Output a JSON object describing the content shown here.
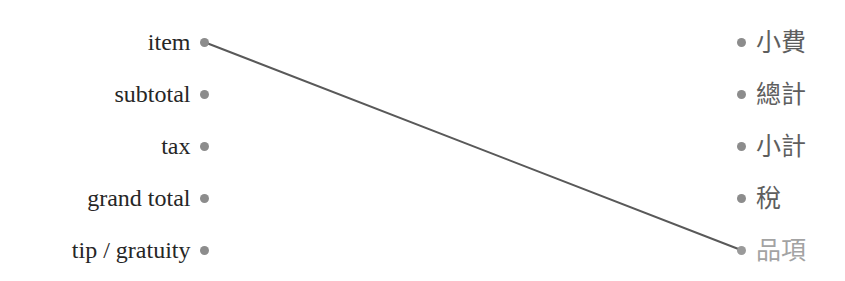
{
  "diagram": {
    "type": "bipartite-alignment",
    "width": 845,
    "height": 281,
    "background_color": "#ffffff",
    "row_spacing_px": 52,
    "first_row_y_px": 42,
    "left_column_dot_x_px": 204,
    "right_column_dot_x_px": 741,
    "edge_color": "#595959",
    "edge_width_px": 2,
    "dot_color": "#8c8c8c",
    "left_text_color": "#262626",
    "right_text_color": "#5e5e5e",
    "right_text_dim_color": "#a3a3a3"
  },
  "left_column": {
    "name": "english-receipt-terms",
    "nodes": [
      {
        "id": "item",
        "label": "item",
        "row": 1,
        "y": 42
      },
      {
        "id": "subtotal",
        "label": "subtotal",
        "row": 2,
        "y": 94
      },
      {
        "id": "tax",
        "label": "tax",
        "row": 3,
        "y": 146
      },
      {
        "id": "grand-total",
        "label": "grand total",
        "row": 4,
        "y": 198
      },
      {
        "id": "tip-gratuity",
        "label": "tip / gratuity",
        "row": 5,
        "y": 250
      }
    ]
  },
  "right_column": {
    "name": "chinese-receipt-terms",
    "nodes": [
      {
        "id": "tip",
        "label": "小費",
        "row": 1,
        "y": 42,
        "dim": false
      },
      {
        "id": "grand-total",
        "label": "總計",
        "row": 2,
        "y": 94,
        "dim": false
      },
      {
        "id": "subtotal",
        "label": "小計",
        "row": 3,
        "y": 146,
        "dim": false
      },
      {
        "id": "tax",
        "label": "稅",
        "row": 4,
        "y": 198,
        "dim": false
      },
      {
        "id": "item",
        "label": "品項",
        "row": 5,
        "y": 250,
        "dim": true
      }
    ]
  },
  "edges": [
    {
      "id": "item-to-pinxiang",
      "from": "item",
      "to": "品項",
      "x1": 204,
      "y1": 42,
      "x2": 741,
      "y2": 250
    }
  ]
}
